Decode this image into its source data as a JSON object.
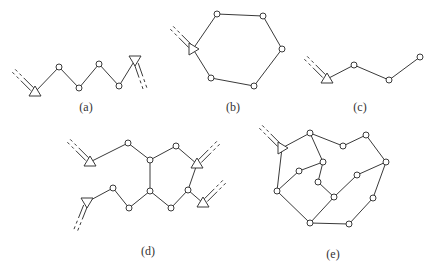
{
  "colors": {
    "stroke": "#3a3a3a",
    "node_fill": "#ffffff",
    "background": "#ffffff"
  },
  "diagrams": [
    {
      "id": "a",
      "label": "(a)",
      "label_pos": [
        86,
        100
      ],
      "nodes": [
        [
          59,
          67
        ],
        [
          79,
          88
        ],
        [
          99,
          64
        ],
        [
          119,
          86
        ]
      ],
      "supports": [
        {
          "pos": [
            35,
            92
          ],
          "dir": "up",
          "hatch": [
            -1,
            -1
          ]
        },
        {
          "pos": [
            135,
            60
          ],
          "dir": "down",
          "hatch": [
            0.35,
            1
          ]
        }
      ],
      "edges": [
        [
          [
            35,
            92
          ],
          [
            59,
            67
          ]
        ],
        [
          [
            59,
            67
          ],
          [
            79,
            88
          ]
        ],
        [
          [
            79,
            88
          ],
          [
            99,
            64
          ]
        ],
        [
          [
            99,
            64
          ],
          [
            119,
            86
          ]
        ],
        [
          [
            119,
            86
          ],
          [
            135,
            60
          ]
        ]
      ]
    },
    {
      "id": "b",
      "label": "(b)",
      "label_pos": [
        233,
        100
      ],
      "nodes": [
        [
          217,
          14
        ],
        [
          263,
          16
        ],
        [
          282,
          49
        ],
        [
          254,
          86
        ],
        [
          211,
          78
        ]
      ],
      "supports": [
        {
          "pos": [
            193,
            49
          ],
          "dir": "right",
          "hatch": [
            -1,
            -1
          ]
        }
      ],
      "edges": [
        [
          [
            193,
            49
          ],
          [
            217,
            14
          ]
        ],
        [
          [
            217,
            14
          ],
          [
            263,
            16
          ]
        ],
        [
          [
            263,
            16
          ],
          [
            282,
            49
          ]
        ],
        [
          [
            282,
            49
          ],
          [
            254,
            86
          ]
        ],
        [
          [
            254,
            86
          ],
          [
            211,
            78
          ]
        ],
        [
          [
            211,
            78
          ],
          [
            193,
            49
          ]
        ]
      ]
    },
    {
      "id": "c",
      "label": "(c)",
      "label_pos": [
        360,
        100
      ],
      "nodes": [
        [
          354,
          65
        ],
        [
          389,
          80
        ],
        [
          420,
          57
        ]
      ],
      "supports": [
        {
          "pos": [
            327,
            79
          ],
          "dir": "up",
          "hatch": [
            -1,
            -1
          ]
        }
      ],
      "edges": [
        [
          [
            327,
            79
          ],
          [
            354,
            65
          ]
        ],
        [
          [
            354,
            65
          ],
          [
            389,
            80
          ]
        ],
        [
          [
            389,
            80
          ],
          [
            420,
            57
          ]
        ]
      ]
    },
    {
      "id": "d",
      "label": "(d)",
      "label_pos": [
        148,
        244
      ],
      "nodes": [
        [
          128,
          143
        ],
        [
          150,
          160
        ],
        [
          176,
          146
        ],
        [
          150,
          191
        ],
        [
          113,
          188
        ],
        [
          129,
          208
        ],
        [
          171,
          208
        ],
        [
          188,
          190
        ]
      ],
      "supports": [
        {
          "pos": [
            90,
            162
          ],
          "dir": "up",
          "hatch": [
            -1,
            -1
          ]
        },
        {
          "pos": [
            197,
            164
          ],
          "dir": "up",
          "hatch": [
            1,
            -1
          ]
        },
        {
          "pos": [
            203,
            203
          ],
          "dir": "up",
          "hatch": [
            1,
            -1
          ]
        },
        {
          "pos": [
            87,
            202
          ],
          "dir": "down",
          "hatch": [
            -0.4,
            1
          ]
        }
      ],
      "edges": [
        [
          [
            90,
            162
          ],
          [
            128,
            143
          ]
        ],
        [
          [
            128,
            143
          ],
          [
            150,
            160
          ]
        ],
        [
          [
            150,
            160
          ],
          [
            176,
            146
          ]
        ],
        [
          [
            176,
            146
          ],
          [
            197,
            164
          ]
        ],
        [
          [
            150,
            160
          ],
          [
            150,
            191
          ]
        ],
        [
          [
            197,
            164
          ],
          [
            188,
            190
          ]
        ],
        [
          [
            188,
            190
          ],
          [
            203,
            203
          ]
        ],
        [
          [
            87,
            202
          ],
          [
            113,
            188
          ]
        ],
        [
          [
            113,
            188
          ],
          [
            129,
            208
          ]
        ],
        [
          [
            129,
            208
          ],
          [
            150,
            191
          ]
        ],
        [
          [
            150,
            191
          ],
          [
            171,
            208
          ]
        ],
        [
          [
            171,
            208
          ],
          [
            188,
            190
          ]
        ]
      ]
    },
    {
      "id": "e",
      "label": "(e)",
      "label_pos": [
        333,
        247
      ],
      "nodes": [
        [
          310,
          133
        ],
        [
          343,
          146
        ],
        [
          366,
          135
        ],
        [
          386,
          162
        ],
        [
          373,
          198
        ],
        [
          349,
          224
        ],
        [
          310,
          223
        ],
        [
          277,
          191
        ],
        [
          299,
          171
        ],
        [
          323,
          162
        ],
        [
          318,
          182
        ],
        [
          334,
          197
        ],
        [
          357,
          175
        ]
      ],
      "supports": [
        {
          "pos": [
            282,
            148
          ],
          "dir": "right",
          "hatch": [
            -1,
            -1
          ]
        }
      ],
      "edges": [
        [
          [
            282,
            148
          ],
          [
            310,
            133
          ]
        ],
        [
          [
            310,
            133
          ],
          [
            343,
            146
          ]
        ],
        [
          [
            343,
            146
          ],
          [
            366,
            135
          ]
        ],
        [
          [
            366,
            135
          ],
          [
            386,
            162
          ]
        ],
        [
          [
            386,
            162
          ],
          [
            373,
            198
          ]
        ],
        [
          [
            373,
            198
          ],
          [
            349,
            224
          ]
        ],
        [
          [
            349,
            224
          ],
          [
            310,
            223
          ]
        ],
        [
          [
            310,
            223
          ],
          [
            277,
            191
          ]
        ],
        [
          [
            277,
            191
          ],
          [
            282,
            148
          ]
        ],
        [
          [
            277,
            191
          ],
          [
            299,
            171
          ]
        ],
        [
          [
            299,
            171
          ],
          [
            323,
            162
          ]
        ],
        [
          [
            310,
            133
          ],
          [
            323,
            162
          ]
        ],
        [
          [
            323,
            162
          ],
          [
            318,
            182
          ]
        ],
        [
          [
            318,
            182
          ],
          [
            334,
            197
          ]
        ],
        [
          [
            334,
            197
          ],
          [
            310,
            223
          ]
        ],
        [
          [
            334,
            197
          ],
          [
            357,
            175
          ]
        ],
        [
          [
            357,
            175
          ],
          [
            386,
            162
          ]
        ]
      ]
    }
  ]
}
